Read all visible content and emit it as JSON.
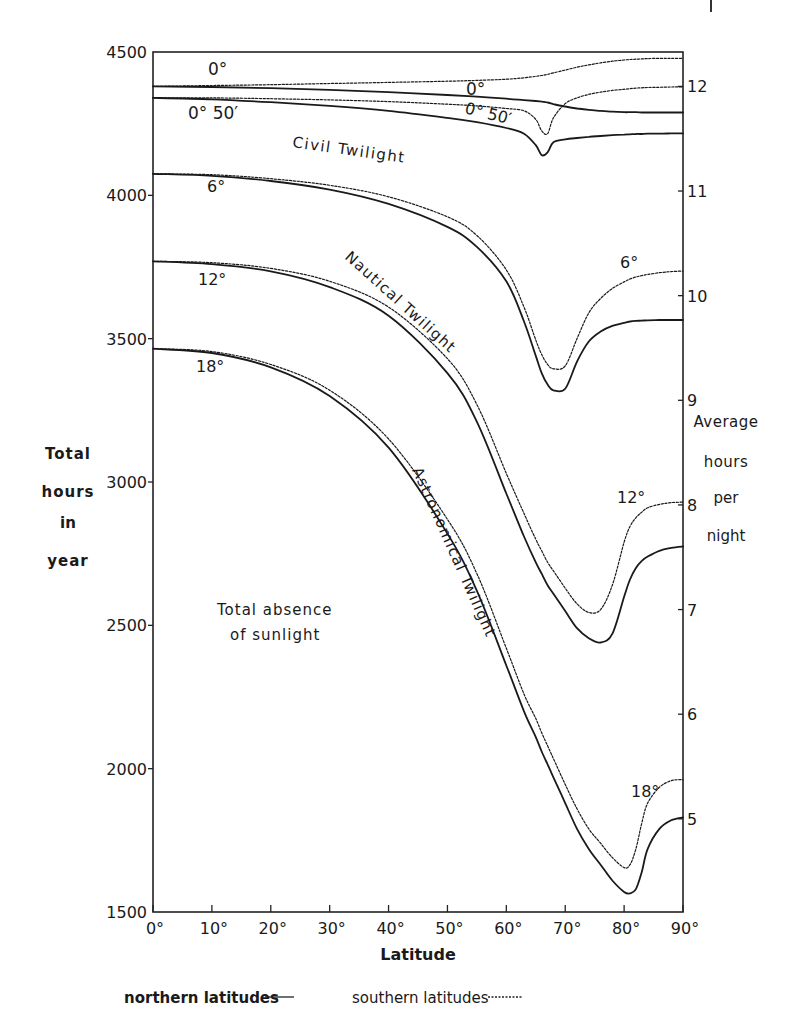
{
  "chart_data": {
    "type": "line",
    "title": "",
    "xlabel": "Latitude",
    "ylabel": "Total hours in year",
    "ylabel_lines": [
      "Total",
      "hours",
      "in",
      "year"
    ],
    "ylabel_right": "Average hours per night",
    "ylabel_right_lines": [
      "Average",
      "hours",
      "per",
      "night"
    ],
    "xlim": [
      0,
      90
    ],
    "ylim": [
      1500,
      4500
    ],
    "ylim_right": [
      4.11,
      12.33
    ],
    "x_ticks": [
      0,
      10,
      20,
      30,
      40,
      50,
      60,
      70,
      80,
      90
    ],
    "x_tick_labels": [
      "0°",
      "10°",
      "20°",
      "30°",
      "40°",
      "50°",
      "60°",
      "70°",
      "80°",
      "90°"
    ],
    "y_ticks": [
      1500,
      2000,
      2500,
      3000,
      3500,
      4000,
      4500
    ],
    "y_tick_labels": [
      "1500",
      "2000",
      "2500",
      "3000",
      "3500",
      "4000",
      "4500"
    ],
    "y_right_ticks": [
      5,
      6,
      7,
      8,
      9,
      10,
      11,
      12
    ],
    "y_right_tick_labels": [
      "5",
      "6",
      "7",
      "8",
      "9",
      "10",
      "11",
      "12"
    ],
    "grid": false,
    "legend": {
      "position": "bottom",
      "entries": [
        {
          "label": "northern latitudes",
          "style": "solid"
        },
        {
          "label": "southern latitudes",
          "style": "dotted"
        }
      ]
    },
    "x": [
      0,
      10,
      20,
      30,
      40,
      50,
      55,
      60,
      63,
      65,
      66,
      67,
      68,
      70,
      72,
      74,
      76,
      78,
      80,
      81,
      82,
      83,
      84,
      86,
      88,
      90
    ],
    "series": [
      {
        "name": "0° northern",
        "style": "solid",
        "values": [
          4380,
          4378,
          4374,
          4368,
          4360,
          4350,
          4344,
          4337,
          4332,
          4329,
          4327,
          4324,
          4318,
          4310,
          4303,
          4298,
          4295,
          4292,
          4290,
          4290,
          4290,
          4289,
          4289,
          4289,
          4289,
          4289
        ]
      },
      {
        "name": "0° southern",
        "style": "dotted",
        "values": [
          4380,
          4383,
          4386,
          4390,
          4394,
          4398,
          4401,
          4405,
          4410,
          4415,
          4418,
          4422,
          4427,
          4437,
          4447,
          4455,
          4462,
          4468,
          4472,
          4474,
          4475,
          4476,
          4477,
          4478,
          4478,
          4478
        ]
      },
      {
        "name": "0° 50′ northern",
        "style": "solid",
        "values": [
          4340,
          4335,
          4325,
          4312,
          4295,
          4270,
          4255,
          4235,
          4215,
          4175,
          4140,
          4150,
          4185,
          4195,
          4200,
          4204,
          4207,
          4210,
          4212,
          4213,
          4214,
          4214,
          4215,
          4215,
          4216,
          4216
        ]
      },
      {
        "name": "0° 50′ southern",
        "style": "dotted",
        "values": [
          4340,
          4340,
          4337,
          4333,
          4327,
          4318,
          4312,
          4303,
          4295,
          4265,
          4225,
          4215,
          4270,
          4320,
          4340,
          4352,
          4360,
          4366,
          4370,
          4372,
          4374,
          4375,
          4376,
          4377,
          4378,
          4378
        ]
      },
      {
        "name": "6° northern",
        "style": "solid",
        "values": [
          4075,
          4068,
          4050,
          4020,
          3970,
          3890,
          3820,
          3700,
          3560,
          3440,
          3380,
          3340,
          3320,
          3325,
          3420,
          3490,
          3525,
          3545,
          3555,
          3560,
          3562,
          3563,
          3564,
          3565,
          3565,
          3565
        ]
      },
      {
        "name": "6° southern",
        "style": "dotted",
        "values": [
          4075,
          4072,
          4058,
          4035,
          3995,
          3925,
          3860,
          3740,
          3610,
          3495,
          3445,
          3410,
          3395,
          3405,
          3500,
          3590,
          3640,
          3675,
          3698,
          3708,
          3715,
          3720,
          3724,
          3730,
          3734,
          3736
        ]
      },
      {
        "name": "12° northern",
        "style": "solid",
        "values": [
          3770,
          3760,
          3735,
          3680,
          3580,
          3380,
          3210,
          2960,
          2810,
          2720,
          2680,
          2640,
          2610,
          2550,
          2490,
          2455,
          2440,
          2470,
          2600,
          2660,
          2700,
          2725,
          2740,
          2760,
          2770,
          2775
        ]
      },
      {
        "name": "12° southern",
        "style": "dotted",
        "values": [
          3770,
          3765,
          3745,
          3700,
          3610,
          3430,
          3270,
          3030,
          2890,
          2800,
          2760,
          2720,
          2690,
          2630,
          2575,
          2545,
          2555,
          2640,
          2790,
          2845,
          2875,
          2895,
          2910,
          2922,
          2928,
          2930
        ]
      },
      {
        "name": "18° northern",
        "style": "solid",
        "values": [
          3465,
          3450,
          3400,
          3300,
          3120,
          2820,
          2620,
          2360,
          2200,
          2110,
          2060,
          2015,
          1970,
          1880,
          1790,
          1720,
          1665,
          1610,
          1570,
          1565,
          1580,
          1640,
          1720,
          1790,
          1820,
          1830
        ]
      },
      {
        "name": "18° southern",
        "style": "dotted",
        "values": [
          3465,
          3455,
          3410,
          3320,
          3150,
          2870,
          2680,
          2420,
          2260,
          2175,
          2125,
          2080,
          2035,
          1945,
          1860,
          1790,
          1740,
          1690,
          1655,
          1665,
          1720,
          1810,
          1880,
          1935,
          1958,
          1962
        ]
      }
    ],
    "annotations": [
      {
        "text": "0°",
        "x": 10,
        "y": 4440
      },
      {
        "text": "0°",
        "x": 58,
        "y": 4365
      },
      {
        "text": "0° 50′",
        "x": 5,
        "y": 4290
      },
      {
        "text": "0° 50′",
        "x": 56,
        "y": 4260
      },
      {
        "text": "Civil Twilight",
        "x": 32,
        "y": 4200,
        "rotation": 8
      },
      {
        "text": "6°",
        "x": 10,
        "y": 4040
      },
      {
        "text": "6°",
        "x": 85,
        "y": 3780
      },
      {
        "text": "Nautical Twilight",
        "x": 55,
        "y": 3650,
        "rotation": 45
      },
      {
        "text": "12°",
        "x": 9,
        "y": 3730
      },
      {
        "text": "12°",
        "x": 85,
        "y": 2985
      },
      {
        "text": "18°",
        "x": 9,
        "y": 3425
      },
      {
        "text": "Astronomical Twilight",
        "x": 57,
        "y": 2850,
        "rotation": 66
      },
      {
        "text": "18°",
        "x": 84,
        "y": 2000
      },
      {
        "text": "Total absence",
        "x": 18,
        "y": 2585
      },
      {
        "text": "of sunlight",
        "x": 18,
        "y": 2510
      }
    ]
  },
  "labels": {
    "xlabel": "Latitude",
    "legend_north": "northern latitudes",
    "legend_south": "southern latitudes",
    "region_civil": "Civil Twilight",
    "region_nautical": "Nautical Twilight",
    "region_astronomical": "Astronomical Twilight",
    "region_dark_line1": "Total absence",
    "region_dark_line2": "of sunlight",
    "ylabel_left": [
      "Total",
      "hours",
      "in",
      "year"
    ],
    "ylabel_right": [
      "Average",
      "hours",
      "per",
      "night"
    ],
    "curve_labels": {
      "zero_left": "0°",
      "zero_right": "0°",
      "zero50_left": "0° 50′",
      "zero50_right": "0° 50′",
      "six_left": "6°",
      "six_right": "6°",
      "twelve_left": "12°",
      "twelve_right": "12°",
      "eighteen_left": "18°",
      "eighteen_right": "18°"
    }
  }
}
